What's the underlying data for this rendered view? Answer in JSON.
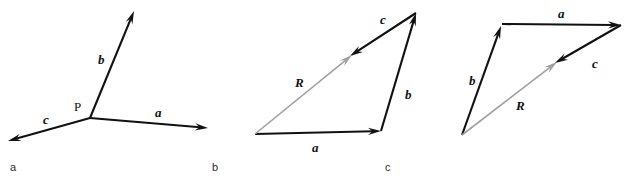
{
  "figure": {
    "background_color": "#ffffff",
    "vector_color": "#111111",
    "resultant_color": "#a0a0a0",
    "panels": [
      {
        "id": "a",
        "caption": "a",
        "caption_pos": {
          "x": 10,
          "y": 162
        },
        "origin_label": "P",
        "origin_label_pos": {
          "x": 74,
          "y": 100
        },
        "vectors": [
          {
            "name": "b",
            "label": "b",
            "label_pos": {
              "x": 98,
              "y": 53
            },
            "color": "#111111",
            "from": {
              "x": 90,
              "y": 118
            },
            "to": {
              "x": 134,
              "y": 11
            }
          },
          {
            "name": "a",
            "label": "a",
            "label_pos": {
              "x": 155,
              "y": 106
            },
            "color": "#111111",
            "from": {
              "x": 90,
              "y": 118
            },
            "to": {
              "x": 208,
              "y": 128
            }
          },
          {
            "name": "c",
            "label": "c",
            "label_pos": {
              "x": 43,
              "y": 113
            },
            "color": "#111111",
            "from": {
              "x": 90,
              "y": 118
            },
            "to": {
              "x": 8,
              "y": 141
            }
          }
        ]
      },
      {
        "id": "b",
        "caption": "b",
        "caption_pos": {
          "x": 212,
          "y": 162
        },
        "vectors": [
          {
            "name": "a",
            "label": "a",
            "label_pos": {
              "x": 312,
              "y": 141
            },
            "color": "#111111",
            "from": {
              "x": 255,
              "y": 134
            },
            "to": {
              "x": 381,
              "y": 131
            }
          },
          {
            "name": "b",
            "label": "b",
            "label_pos": {
              "x": 405,
              "y": 88
            },
            "color": "#111111",
            "from": {
              "x": 381,
              "y": 131
            },
            "to": {
              "x": 416,
              "y": 13
            }
          },
          {
            "name": "c",
            "label": "c",
            "label_pos": {
              "x": 380,
              "y": 13
            },
            "color": "#111111",
            "from": {
              "x": 416,
              "y": 13
            },
            "to": {
              "x": 350,
              "y": 56
            }
          },
          {
            "name": "R",
            "label": "R",
            "label_pos": {
              "x": 295,
              "y": 76
            },
            "color": "#a0a0a0",
            "from": {
              "x": 255,
              "y": 134
            },
            "to": {
              "x": 352,
              "y": 55
            }
          }
        ]
      },
      {
        "id": "c",
        "caption": "c",
        "caption_pos": {
          "x": 385,
          "y": 162
        },
        "vectors": [
          {
            "name": "b",
            "label": "b",
            "label_pos": {
              "x": 469,
              "y": 74
            },
            "color": "#111111",
            "from": {
              "x": 462,
              "y": 135
            },
            "to": {
              "x": 501,
              "y": 26
            }
          },
          {
            "name": "a",
            "label": "a",
            "label_pos": {
              "x": 558,
              "y": 7
            },
            "color": "#111111",
            "from": {
              "x": 502,
              "y": 24
            },
            "to": {
              "x": 621,
              "y": 25
            }
          },
          {
            "name": "c",
            "label": "c",
            "label_pos": {
              "x": 592,
              "y": 57
            },
            "color": "#111111",
            "from": {
              "x": 621,
              "y": 25
            },
            "to": {
              "x": 555,
              "y": 63
            }
          },
          {
            "name": "R",
            "label": "R",
            "label_pos": {
              "x": 516,
              "y": 99
            },
            "color": "#a0a0a0",
            "from": {
              "x": 462,
              "y": 135
            },
            "to": {
              "x": 557,
              "y": 62
            }
          }
        ]
      }
    ]
  }
}
